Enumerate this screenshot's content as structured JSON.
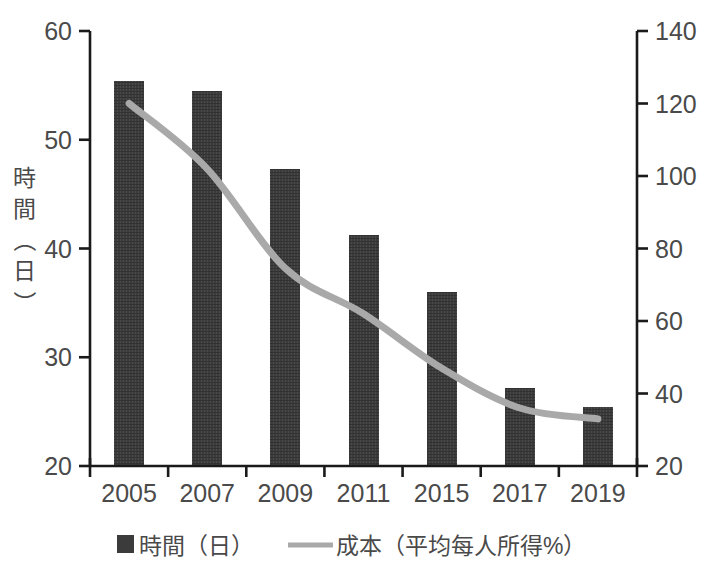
{
  "chart_data": {
    "type": "bar",
    "title": "",
    "subtitle": "",
    "xlabel": "",
    "ylabel": "時間（日）",
    "y2label": "",
    "categories": [
      "2005",
      "2007",
      "2009",
      "2011",
      "2015",
      "2017",
      "2019"
    ],
    "grid": false,
    "legend_position": "bottom",
    "ylim": [
      20,
      60
    ],
    "yticks": [
      "20",
      "30",
      "40",
      "50",
      "60"
    ],
    "ylim_right": [
      20,
      140
    ],
    "yticks_right": [
      "20",
      "40",
      "60",
      "80",
      "100",
      "120",
      "140"
    ],
    "series": [
      {
        "name": "時間（日）",
        "type": "bar",
        "axis": "left",
        "color": "#3b3b3b",
        "values": [
          55.4,
          54.5,
          47.3,
          41.2,
          36.0,
          27.2,
          25.4
        ]
      },
      {
        "name": "成本（平均每人所得%）",
        "type": "line",
        "axis": "right",
        "color": "#a9a9a9",
        "values": [
          120.0,
          102.0,
          74.5,
          62.0,
          47.0,
          36.0,
          33.0
        ]
      }
    ]
  },
  "legend": {
    "items": [
      {
        "label": "時間（日）",
        "marker": "square-marker",
        "color": "#3b3b3b"
      },
      {
        "label": "成本（平均每人所得%）",
        "marker": "line-marker",
        "color": "#a9a9a9"
      }
    ]
  },
  "axes": {
    "left_title": "時間（日）",
    "left_ticks": [
      "60",
      "50",
      "40",
      "30",
      "20"
    ],
    "right_ticks": [
      "140",
      "120",
      "100",
      "80",
      "60",
      "40",
      "20"
    ],
    "x_ticks": [
      "2005",
      "2007",
      "2009",
      "2011",
      "2015",
      "2017",
      "2019"
    ]
  }
}
